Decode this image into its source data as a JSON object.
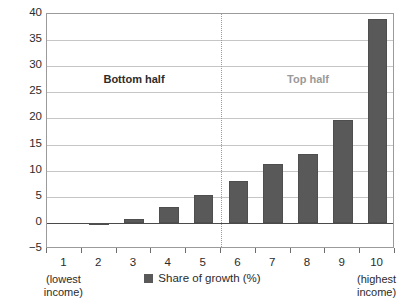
{
  "chart_data": {
    "type": "bar",
    "title": "",
    "subtitle": "",
    "xlabel": "",
    "ylabel": "",
    "categories": [
      "1",
      "2",
      "3",
      "4",
      "5",
      "6",
      "7",
      "8",
      "9",
      "10"
    ],
    "values": [
      0.0,
      -0.5,
      0.7,
      3.0,
      5.4,
      8.0,
      11.3,
      13.2,
      19.7,
      39.0
    ],
    "series": [
      {
        "name": "Share of growth (%)",
        "values": [
          0.0,
          -0.5,
          0.7,
          3.0,
          5.4,
          8.0,
          11.3,
          13.2,
          19.7,
          39.0
        ],
        "color": "#595959"
      }
    ],
    "ylim": [
      -5,
      40
    ],
    "yticks": [
      -5,
      0,
      5,
      10,
      15,
      20,
      25,
      30,
      35,
      40
    ],
    "ytick_labels": [
      "−5",
      "0",
      "5",
      "10",
      "15",
      "20",
      "25",
      "30",
      "35",
      "40"
    ],
    "grid": true,
    "grid_axis": "y",
    "legend": {
      "position": "bottom-center",
      "entries": [
        {
          "label": "Share of growth (%)",
          "color": "#595959",
          "marker": "square"
        }
      ]
    },
    "annotations": [
      {
        "text": "Bottom half",
        "region": "left",
        "color": "#2c2c2c",
        "bold": true
      },
      {
        "text": "Top half",
        "region": "right",
        "color": "#9a9a9a",
        "bold": true
      }
    ],
    "divider": {
      "style": "dotted",
      "between_categories": [
        "5",
        "6"
      ],
      "color": "#9a9a9a"
    },
    "axis_notes": [
      {
        "text": "(lowest\nincome)",
        "line1": "(lowest",
        "line2": "income)",
        "anchor": "1"
      },
      {
        "text": "(highest\nincome)",
        "line1": "(highest",
        "line2": "income)",
        "anchor": "10"
      }
    ]
  },
  "axis": {
    "y_labels": [
      "40",
      "35",
      "30",
      "25",
      "20",
      "15",
      "10",
      "5",
      "0",
      "−5"
    ],
    "x_labels": [
      "1",
      "2",
      "3",
      "4",
      "5",
      "6",
      "7",
      "8",
      "9",
      "10"
    ]
  },
  "annotations": {
    "bottom_half": "Bottom half",
    "top_half": "Top half"
  },
  "notes": {
    "lowest_line1": "(lowest",
    "lowest_line2": "income)",
    "highest_line1": "(highest",
    "highest_line2": "income)"
  },
  "legend": {
    "label": "Share of growth (%)"
  },
  "colors": {
    "bar": "#595959",
    "grid": "#c6c6c6",
    "frame": "#9b9b9b",
    "zero_axis": "#4a4a4a",
    "divider": "#9a9a9a",
    "text": "#2b2b2b",
    "muted_text": "#9a9a9a"
  }
}
